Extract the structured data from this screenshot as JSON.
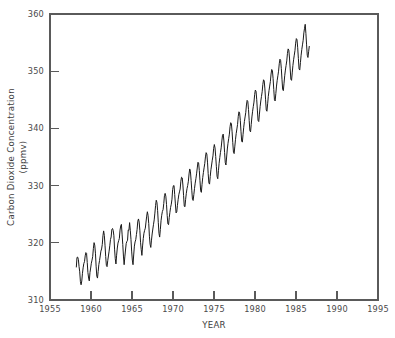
{
  "chart_data": {
    "type": "line",
    "title": "",
    "xlabel": "YEAR",
    "ylabel": "Carbon Dioxide Concentration (ppmv)",
    "ylabel_line1": "Carbon Dioxide Concentration",
    "ylabel_line2": "(ppmv)",
    "xlim": [
      1955,
      1995
    ],
    "ylim": [
      310,
      360
    ],
    "xticks": [
      1955,
      1960,
      1965,
      1970,
      1975,
      1980,
      1985,
      1990,
      1995
    ],
    "yticks": [
      310,
      320,
      330,
      340,
      350,
      360
    ],
    "xtick_labels": [
      "1955",
      "1960",
      "1965",
      "1970",
      "1975",
      "1980",
      "1985",
      "1990",
      "1995"
    ],
    "ytick_labels": [
      "310",
      "320",
      "330",
      "340",
      "350",
      "360"
    ],
    "grid": false,
    "legend": null,
    "series_name": "Mauna Loa monthly mean CO2",
    "line_color": "#1a1a1a",
    "axis_color": "#5a5a5a",
    "background_color": "#ffffff",
    "x_start": 1958.208,
    "x_step": 0.08333,
    "y_units": "ppmv",
    "x_units": "year",
    "note": "Monthly mean atmospheric CO2 concentration, Mauna Loa Observatory (Keeling Curve). x runs from Mar 1958 in monthly steps.",
    "values": [
      315.7,
      317.45,
      317.5,
      317.1,
      315.86,
      314.93,
      313.2,
      312.66,
      313.33,
      314.67,
      315.62,
      316.38,
      316.71,
      317.72,
      318.29,
      318.16,
      316.55,
      314.8,
      313.84,
      313.34,
      314.81,
      315.59,
      316.43,
      316.97,
      317.58,
      319.03,
      320.03,
      319.59,
      318.18,
      315.91,
      314.16,
      313.83,
      315.0,
      316.19,
      316.89,
      317.7,
      318.54,
      318.92,
      319.7,
      321.22,
      322.08,
      321.31,
      319.58,
      317.61,
      316.05,
      315.83,
      316.88,
      317.7,
      318.54,
      319.48,
      320.58,
      321.02,
      322.33,
      322.5,
      322.17,
      321.23,
      318.89,
      317.22,
      316.3,
      317.83,
      319.09,
      319.95,
      320.37,
      320.77,
      322.22,
      322.95,
      323.22,
      321.52,
      319.71,
      317.68,
      316.17,
      317.53,
      318.74,
      319.88,
      320.23,
      320.45,
      322.25,
      322.19,
      323.53,
      322.19,
      320.6,
      318.55,
      316.98,
      316.17,
      317.87,
      319.42,
      320.15,
      320.55,
      321.45,
      322.36,
      323.78,
      324.17,
      323.62,
      322.2,
      320.1,
      318.8,
      317.8,
      319.45,
      320.75,
      321.67,
      322.18,
      322.56,
      323.63,
      324.66,
      325.43,
      324.8,
      323.36,
      321.15,
      319.75,
      319.19,
      320.47,
      321.54,
      322.41,
      323.24,
      324.0,
      325.19,
      326.52,
      327.44,
      327.06,
      325.62,
      323.51,
      321.62,
      321.0,
      322.32,
      323.85,
      324.82,
      325.48,
      325.8,
      326.86,
      328.24,
      328.64,
      328.15,
      326.72,
      324.78,
      323.32,
      323.17,
      324.42,
      325.33,
      326.2,
      326.75,
      327.63,
      329.3,
      329.96,
      330.02,
      328.46,
      326.8,
      325.23,
      325.4,
      326.55,
      327.53,
      328.4,
      328.9,
      329.4,
      330.77,
      331.47,
      331.35,
      330.1,
      328.24,
      326.4,
      326.29,
      327.6,
      328.65,
      329.46,
      330.01,
      330.76,
      332.04,
      332.91,
      332.52,
      330.9,
      329.2,
      327.6,
      327.4,
      328.43,
      329.51,
      330.43,
      331.19,
      332.05,
      333.08,
      334.08,
      333.96,
      332.65,
      330.85,
      329.09,
      328.82,
      330.2,
      331.39,
      332.28,
      333.1,
      333.88,
      335.02,
      335.76,
      335.52,
      334.1,
      332.1,
      330.48,
      330.26,
      331.6,
      332.77,
      333.6,
      334.44,
      335.2,
      336.5,
      337.18,
      336.6,
      335.1,
      333.3,
      331.6,
      331.2,
      332.6,
      333.9,
      334.9,
      335.8,
      336.6,
      337.8,
      338.8,
      339.0,
      337.8,
      335.8,
      334.0,
      333.6,
      335.0,
      336.4,
      337.4,
      338.2,
      339.0,
      340.3,
      341.0,
      340.8,
      339.4,
      337.5,
      335.8,
      335.6,
      336.9,
      338.1,
      339.1,
      339.9,
      340.7,
      342.1,
      342.9,
      342.7,
      341.4,
      339.5,
      337.8,
      337.6,
      338.9,
      340.2,
      341.2,
      342.0,
      342.8,
      344.1,
      344.9,
      344.7,
      343.3,
      341.4,
      339.6,
      339.4,
      340.7,
      342.0,
      343.0,
      343.8,
      344.6,
      345.9,
      346.7,
      346.5,
      345.1,
      343.2,
      341.4,
      341.2,
      342.5,
      343.8,
      344.8,
      345.6,
      346.4,
      347.7,
      348.5,
      348.3,
      346.9,
      345.0,
      343.2,
      343.0,
      344.3,
      345.6,
      346.6,
      347.4,
      348.2,
      349.5,
      350.3,
      350.1,
      348.7,
      346.8,
      345.0,
      344.8,
      346.1,
      347.4,
      348.4,
      349.2,
      350.0,
      351.3,
      352.1,
      351.9,
      350.5,
      348.6,
      346.8,
      346.6,
      347.9,
      349.2,
      350.2,
      351.0,
      351.8,
      353.1,
      353.9,
      353.7,
      352.3,
      350.4,
      348.6,
      348.4,
      349.7,
      351.0,
      352.0,
      352.8,
      353.6,
      354.9,
      355.7,
      355.5,
      354.1,
      352.2,
      350.4,
      350.2,
      351.5,
      352.8,
      353.8,
      354.6,
      355.4,
      356.7,
      357.5,
      358.2,
      356.6,
      354.6,
      352.8,
      352.4,
      353.4,
      354.4
    ]
  }
}
